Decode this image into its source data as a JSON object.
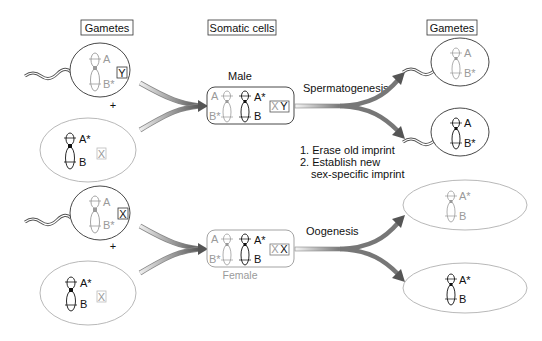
{
  "headers": {
    "gametes_left": "Gametes",
    "somatic_cells": "Somatic cells",
    "gametes_right": "Gametes"
  },
  "labels": {
    "male": "Male",
    "female": "Female",
    "spermatogenesis": "Spermatogenesis",
    "oogenesis": "Oogenesis",
    "plus": "+",
    "step1": "1. Erase old imprint",
    "step2": "2. Establish new",
    "step2b": "sex-specific imprint"
  },
  "genes": {
    "A": "A",
    "B": "B",
    "A_star": "A*",
    "B_star": "B*",
    "star": "*"
  },
  "sex_chromosomes": {
    "Y": "Y",
    "X": "X"
  },
  "colors": {
    "paternal_light": "#9a9a9a",
    "maternal_dark": "#111111",
    "arrow_dark": "#555555",
    "arrow_light": "#e6e6e6",
    "outline": "#333333",
    "egg_outline": "#b0b0b0"
  }
}
